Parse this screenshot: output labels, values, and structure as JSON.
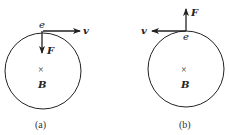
{
  "panels": [
    {
      "caption": "(a)",
      "charge_label": "e",
      "velocity_label": "v",
      "force_label": "F",
      "field_label": "B",
      "field_symbol": "×",
      "velocity_direction": "right",
      "force_direction": "down"
    },
    {
      "caption": "(b)",
      "charge_label": "e",
      "velocity_label": "v",
      "force_label": "F",
      "field_label": "B",
      "field_symbol": "×",
      "velocity_direction": "left",
      "force_direction": "up"
    }
  ],
  "colors": {
    "stroke": "#222222",
    "background": "#ffffff"
  }
}
